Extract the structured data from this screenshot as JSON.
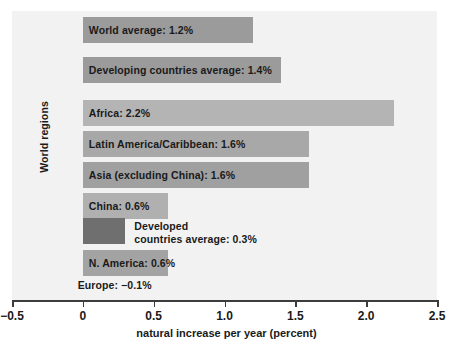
{
  "chart_data": {
    "type": "bar",
    "orientation": "horizontal",
    "title": "",
    "xlabel": "natural increase per year (percent)",
    "ylabel": "World regions",
    "xlim": [
      -0.5,
      2.5
    ],
    "xticks": [
      "−0.5",
      "0",
      "0.5",
      "1.0",
      "1.5",
      "2.0",
      "2.5"
    ],
    "xtick_values": [
      -0.5,
      0,
      0.5,
      1.0,
      1.5,
      2.0,
      2.5
    ],
    "grid": false,
    "legend": "none",
    "categories": [
      "World average",
      "Developing countries average",
      "Africa",
      "Latin America/Caribbean",
      "Asia (excluding China)",
      "China",
      "Developed countries average",
      "N. America",
      "Europe"
    ],
    "values": [
      1.2,
      1.4,
      2.2,
      1.6,
      1.6,
      0.6,
      0.3,
      0.6,
      -0.1
    ],
    "bars": [
      {
        "label": "World average: 1.2%",
        "label_lines": [
          "World average: 1.2%"
        ],
        "value": 1.2,
        "color": "#9b9b9b",
        "label_inside": true,
        "top": 6,
        "left_value": 0
      },
      {
        "label": "Developing countries average: 1.4%",
        "label_lines": [
          "Developing countries average: 1.4%"
        ],
        "value": 1.4,
        "color": "#9b9b9b",
        "label_inside": true,
        "top": 46,
        "left_value": 0
      },
      {
        "label": "Africa: 2.2%",
        "label_lines": [
          "Africa: 2.2%"
        ],
        "value": 2.2,
        "color": "#b4b4b4",
        "label_inside": true,
        "top": 89,
        "left_value": 0
      },
      {
        "label": "Latin America/Caribbean: 1.6%",
        "label_lines": [
          "Latin America/Caribbean: 1.6%"
        ],
        "value": 1.6,
        "color": "#a8a8a8",
        "label_inside": true,
        "top": 120,
        "left_value": 0
      },
      {
        "label": "Asia (excluding China): 1.6%",
        "label_lines": [
          "Asia (excluding China): 1.6%"
        ],
        "value": 1.6,
        "color": "#a0a0a0",
        "label_inside": true,
        "top": 151,
        "left_value": 0
      },
      {
        "label": "China: 0.6%",
        "label_lines": [
          "China: 0.6%"
        ],
        "value": 0.6,
        "color": "#b0b0b0",
        "label_inside": true,
        "top": 182,
        "left_value": 0
      },
      {
        "label": "Developed countries average: 0.3%",
        "label_lines": [
          "Developed",
          "countries average: 0.3%"
        ],
        "value": 0.3,
        "color": "#6f6f6f",
        "label_inside": false,
        "top": 207,
        "left_value": 0
      },
      {
        "label": "N. America: 0.6%",
        "label_lines": [
          "N. America: 0.6%"
        ],
        "value": 0.6,
        "color": "#a3a3a3",
        "label_inside": true,
        "top": 239,
        "left_value": 0
      },
      {
        "label": "Europe: −0.1%",
        "label_lines": [
          "Europe: −0.1%"
        ],
        "value": -0.1,
        "color": "#b6b6b6",
        "label_inside": false,
        "top": 261,
        "left_value": -0.1
      }
    ],
    "colors": {
      "axis": "#3c3c3c",
      "text": "#1a1a1a",
      "plot_background": "#f2f2f2",
      "page_background": "#ffffff"
    }
  }
}
